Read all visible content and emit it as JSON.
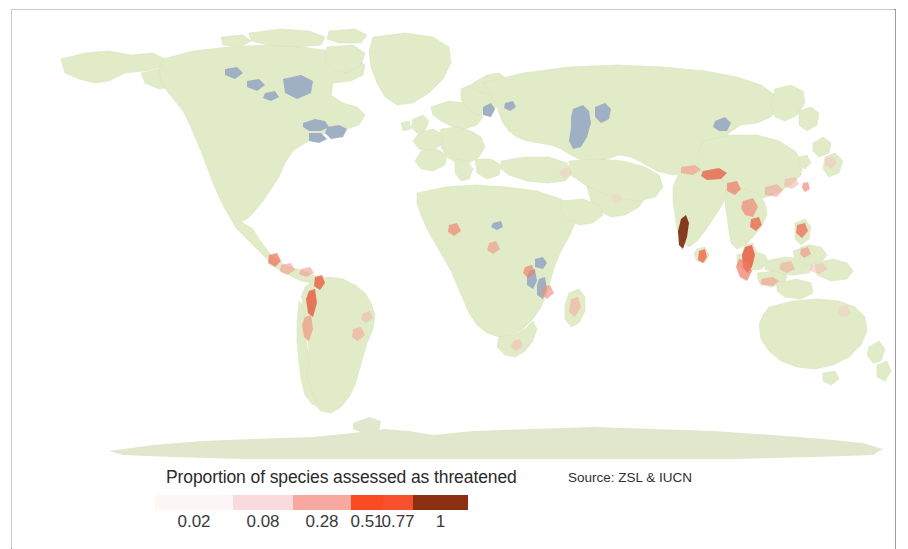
{
  "figure": {
    "type": "choropleth-world-map",
    "background_color": "#ffffff",
    "frame_color": "#8e9094"
  },
  "map": {
    "land_color": "#e2ebc8",
    "land_stroke": "#d5e0b6",
    "water_color": "#ffffff",
    "lake_color": "#9fb0c4",
    "projection": "equirectangular",
    "lon_range": [
      -180,
      180
    ],
    "lat_range": [
      -90,
      -90
    ]
  },
  "legend": {
    "title": "Proportion of species assessed as threatened",
    "source": "Source: ZSL & IUCN",
    "tick_labels": [
      "0.02",
      "0.08",
      "0.28",
      "0.51",
      "0.77",
      "1"
    ],
    "tick_values": [
      0.02,
      0.08,
      0.28,
      0.51,
      0.77,
      1
    ],
    "swatch_colors": [
      "#fdf6f5",
      "#fadbdd",
      "#f7a99f",
      "#fa4a22",
      "#f8502c",
      "#8a2f12"
    ],
    "swatch_widths": [
      78,
      60,
      58,
      32,
      30,
      55
    ]
  },
  "chart_data": {
    "type": "heatmap",
    "title": "Proportion of species assessed as threatened",
    "subtitle": "",
    "xlabel": "",
    "ylabel": "",
    "annotations": [
      "Source: ZSL & IUCN"
    ],
    "legend_position": "bottom-left",
    "grid": false,
    "colorbar": {
      "label": "Proportion of species assessed as threatened",
      "breaks": [
        0.02,
        0.08,
        0.28,
        0.51,
        0.77,
        1
      ],
      "colors": [
        "#fdf6f5",
        "#fadbdd",
        "#f7a99f",
        "#fa4a22",
        "#f8502c",
        "#8a2f12"
      ]
    },
    "hotspots": [
      {
        "name": "Western Ghats, India",
        "lon": 75.5,
        "lat": 12.0,
        "value": 1.0
      },
      {
        "name": "Sri Lanka",
        "lon": 80.7,
        "lat": 7.5,
        "value": 0.95
      },
      {
        "name": "Eastern Himalaya",
        "lon": 92.0,
        "lat": 27.5,
        "value": 0.72
      },
      {
        "name": "Northern India",
        "lon": 77.5,
        "lat": 30.5,
        "value": 0.55
      },
      {
        "name": "Indo-Burma",
        "lon": 99.0,
        "lat": 19.0,
        "value": 0.6
      },
      {
        "name": "Peninsular Malaysia",
        "lon": 101.5,
        "lat": 3.5,
        "value": 0.68
      },
      {
        "name": "Sumatra",
        "lon": 100.5,
        "lat": -1.0,
        "value": 0.62
      },
      {
        "name": "Borneo",
        "lon": 114.0,
        "lat": 1.0,
        "value": 0.5
      },
      {
        "name": "Java",
        "lon": 110.0,
        "lat": -7.2,
        "value": 0.45
      },
      {
        "name": "Philippines",
        "lon": 122.0,
        "lat": 11.5,
        "value": 0.58
      },
      {
        "name": "Southern China",
        "lon": 110.0,
        "lat": 23.5,
        "value": 0.48
      },
      {
        "name": "Taiwan",
        "lon": 121.0,
        "lat": 23.8,
        "value": 0.4
      },
      {
        "name": "New Guinea",
        "lon": 141.0,
        "lat": -5.5,
        "value": 0.35
      },
      {
        "name": "Tropical Andes, Colombia",
        "lon": -75.5,
        "lat": 5.0,
        "value": 0.7
      },
      {
        "name": "Tropical Andes, Ecuador",
        "lon": -78.5,
        "lat": -1.0,
        "value": 0.75
      },
      {
        "name": "Tropical Andes, Peru",
        "lon": -76.5,
        "lat": -9.5,
        "value": 0.55
      },
      {
        "name": "Mesoamerica",
        "lon": -90.5,
        "lat": 15.5,
        "value": 0.52
      },
      {
        "name": "Caribbean islands",
        "lon": -73.0,
        "lat": 19.0,
        "value": 0.45
      },
      {
        "name": "Atlantic Forest, Brazil",
        "lon": -42.0,
        "lat": -21.0,
        "value": 0.5
      },
      {
        "name": "Upper Guinean forests",
        "lon": -9.0,
        "lat": 7.0,
        "value": 0.42
      },
      {
        "name": "Cameroon highlands",
        "lon": 11.0,
        "lat": 5.0,
        "value": 0.45
      },
      {
        "name": "Albertine Rift",
        "lon": 29.5,
        "lat": -2.0,
        "value": 0.48
      },
      {
        "name": "Eastern Arc Mountains",
        "lon": 37.0,
        "lat": -7.5,
        "value": 0.52
      },
      {
        "name": "Madagascar",
        "lon": 47.5,
        "lat": -19.0,
        "value": 0.46
      },
      {
        "name": "Cape Floristic region",
        "lon": 19.5,
        "lat": -33.5,
        "value": 0.4
      },
      {
        "name": "Ghats coastal",
        "lon": 74.0,
        "lat": 16.0,
        "value": 0.65
      },
      {
        "name": "Japan",
        "lon": 136.0,
        "lat": 35.0,
        "value": 0.22
      },
      {
        "name": "Queensland, Australia",
        "lon": 145.5,
        "lat": -17.0,
        "value": 0.3
      }
    ]
  }
}
